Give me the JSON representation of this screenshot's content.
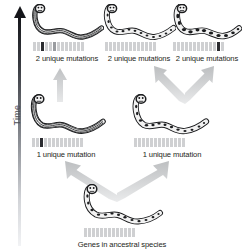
{
  "figure": {
    "type": "phylogenetic-divergence-diagram",
    "bottom_caption": "Genes in ancestral species",
    "time_axis": {
      "label": "Time",
      "direction": "upward",
      "arrow_head": "up"
    }
  },
  "colors": {
    "gene_default": "#cfd0d2",
    "gene_mutation_dark": "#2b2c30",
    "gene_mutation_medium": "#9a9ca0",
    "arrow_gray": "#c9cacc",
    "time_arrow_dark": "#15161a",
    "text": "#1d1e20"
  },
  "nodes": [
    {
      "id": "ancestor",
      "row": "bottom",
      "caption": "Genes in ancestral species",
      "pattern": "spotted",
      "gene_count": 13,
      "genes": [
        "light",
        "light",
        "light",
        "light",
        "light",
        "light",
        "light",
        "light",
        "light",
        "light",
        "light",
        "light",
        "light"
      ]
    },
    {
      "id": "lineage-left-1mut",
      "row": "middle",
      "caption": "1 unique mutation",
      "pattern": "striped",
      "gene_count": 13,
      "genes": [
        "light",
        "light",
        "dark",
        "light",
        "light",
        "light",
        "light",
        "light",
        "light",
        "light",
        "light",
        "light",
        "light"
      ]
    },
    {
      "id": "lineage-right-1mut",
      "row": "middle",
      "caption": "1 unique mutation",
      "pattern": "spotted",
      "gene_count": 13,
      "genes": [
        "light",
        "light",
        "light",
        "light",
        "light",
        "light",
        "light",
        "light",
        "light",
        "light",
        "light",
        "light",
        "light"
      ]
    },
    {
      "id": "descendant-left-2mut",
      "row": "top",
      "caption": "2 unique mutations",
      "pattern": "striped",
      "gene_count": 13,
      "genes": [
        "light",
        "light",
        "dark",
        "light",
        "light",
        "medium",
        "light",
        "light",
        "light",
        "light",
        "light",
        "light",
        "light"
      ]
    },
    {
      "id": "descendant-middle-2mut",
      "row": "top",
      "caption": "2 unique mutations",
      "pattern": "spotted",
      "gene_count": 13,
      "genes": [
        "light",
        "light",
        "light",
        "light",
        "light",
        "light",
        "light",
        "light",
        "light",
        "light",
        "light",
        "light",
        "light"
      ]
    },
    {
      "id": "descendant-right-2mut",
      "row": "top",
      "caption": "2 unique mutations",
      "pattern": "blotchy",
      "gene_count": 13,
      "genes": [
        "light",
        "light",
        "light",
        "light",
        "light",
        "light",
        "light",
        "light",
        "light",
        "light",
        "light",
        "dark",
        "light"
      ]
    }
  ],
  "captions": {
    "top_left": "2 unique mutations",
    "top_middle": "2 unique mutations",
    "top_right": "2 unique mutations",
    "middle_left": "1 unique mutation",
    "middle_right": "1 unique mutation",
    "bottom": "Genes in ancestral species"
  },
  "connectors": [
    {
      "id": "ancestor-to-left",
      "shape": "branch-up-left"
    },
    {
      "id": "ancestor-to-right",
      "shape": "branch-up-right"
    },
    {
      "id": "left-to-top-left",
      "shape": "straight-up"
    },
    {
      "id": "right-to-top-middle",
      "shape": "branch-up-left"
    },
    {
      "id": "right-to-top-right",
      "shape": "branch-up-right"
    }
  ]
}
